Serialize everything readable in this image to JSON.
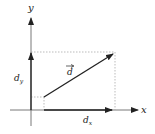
{
  "diagram": {
    "type": "vector-decomposition",
    "axes": {
      "x_label": "x",
      "y_label": "y"
    },
    "vector": {
      "label": "d",
      "has_arrow_accent": true
    },
    "components": {
      "x_label_base": "d",
      "x_label_sub": "x",
      "y_label_base": "d",
      "y_label_sub": "y"
    },
    "colors": {
      "line": "#222222",
      "dotted": "#aaaaaa",
      "background": "#ffffff"
    }
  }
}
